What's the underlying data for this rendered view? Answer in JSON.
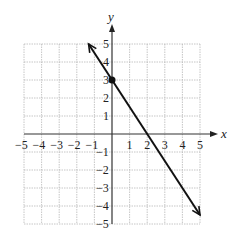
{
  "chart_data": {
    "type": "line",
    "title": "",
    "xlabel": "x",
    "ylabel": "y",
    "xlim": [
      -5,
      5
    ],
    "ylim": [
      -5,
      5
    ],
    "grid": true,
    "x_ticks": [
      "-5",
      "-4",
      "-3",
      "-2",
      "-1",
      "1",
      "2",
      "3",
      "4",
      "5"
    ],
    "y_ticks": [
      "5",
      "4",
      "3",
      "2",
      "1",
      "-1",
      "-2",
      "-3",
      "-4",
      "-5"
    ],
    "series": [
      {
        "name": "line",
        "equation": "y = -3/2 x + 3",
        "x": [
          -1.33,
          0,
          2,
          5
        ],
        "y": [
          5,
          3,
          0,
          -4.5
        ],
        "arrows_both_ends": true
      }
    ],
    "marked_points": [
      {
        "x": 0,
        "y": 3,
        "label": "y-intercept"
      }
    ]
  },
  "labels": {
    "x_axis": "x",
    "y_axis": "y"
  }
}
